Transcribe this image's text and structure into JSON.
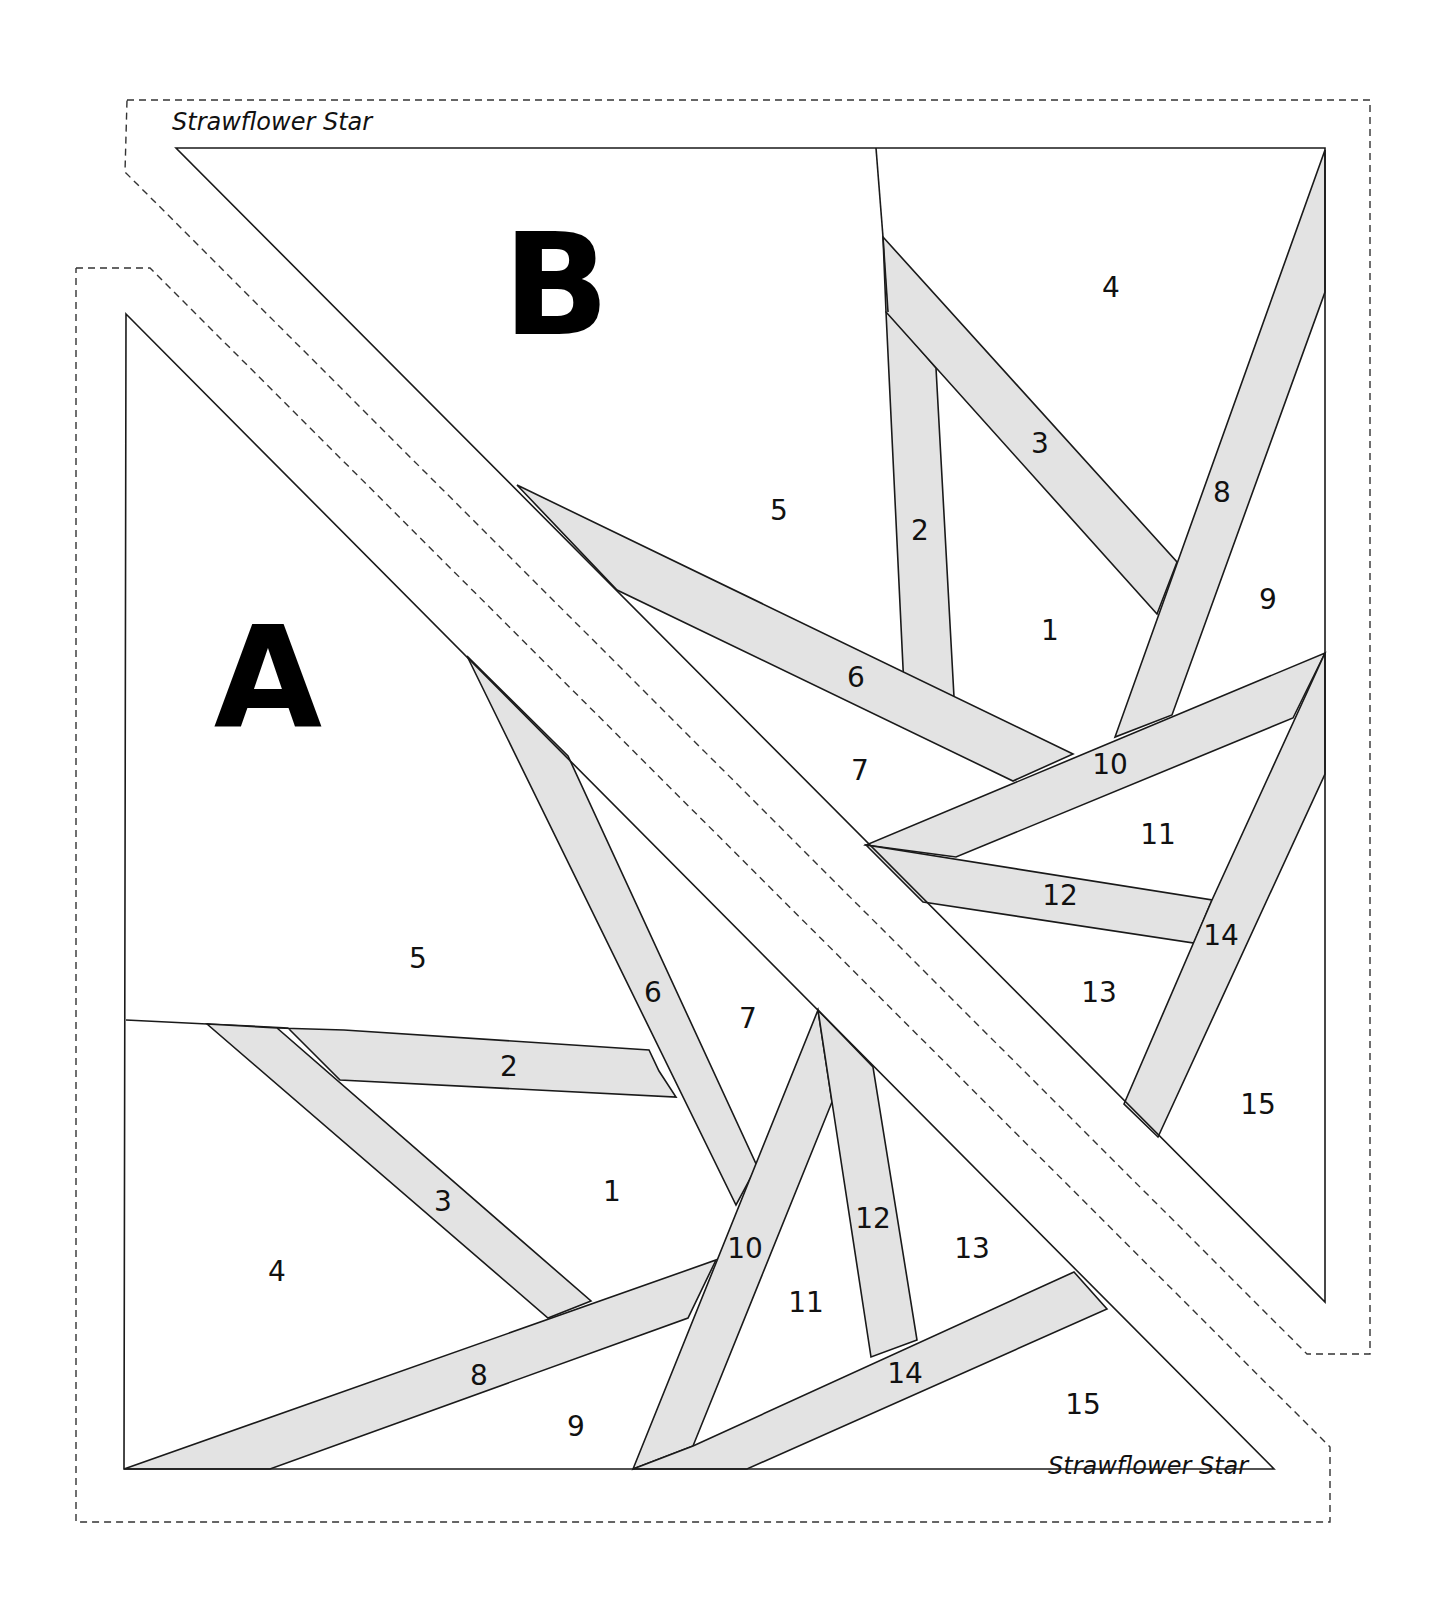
{
  "pattern": {
    "title": "Strawflower Star",
    "block_a": {
      "label": "A",
      "pieces": [
        "1",
        "2",
        "3",
        "4",
        "5",
        "6",
        "7",
        "8",
        "9",
        "10",
        "11",
        "12",
        "13",
        "14",
        "15"
      ]
    },
    "block_b": {
      "label": "B",
      "pieces": [
        "1",
        "2",
        "3",
        "4",
        "5",
        "6",
        "7",
        "8",
        "9",
        "10",
        "11",
        "12",
        "13",
        "14",
        "15"
      ]
    },
    "colors": {
      "strip_fill": "#e3e3e3",
      "line": "#1a1a1a",
      "background": "#ffffff"
    }
  }
}
